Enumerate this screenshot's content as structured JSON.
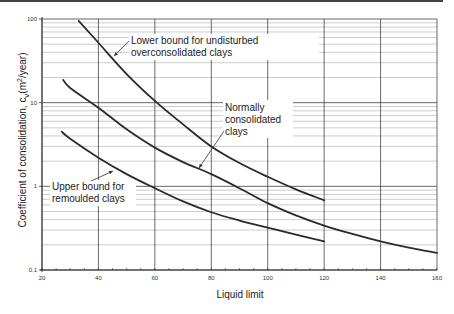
{
  "chart_data": {
    "type": "line",
    "title": "",
    "xlabel": "Liquid limit",
    "ylabel": "Coefficient of consolidation, c",
    "ylabel_subscript": "v",
    "ylabel_units": "(m²/year)",
    "xlim": [
      20,
      160
    ],
    "ylim": [
      0.1,
      100
    ],
    "yscale": "log",
    "grid": true,
    "x_ticks": [
      20,
      40,
      60,
      80,
      100,
      120,
      140,
      160
    ],
    "y_ticks": [
      0.1,
      1,
      10,
      100
    ],
    "y_tick_labels": [
      "0.1",
      "1",
      "10",
      "100"
    ],
    "series": [
      {
        "name": "Lower bound for undisturbed overconsolidated clays",
        "x": [
          33,
          40,
          50,
          60,
          70,
          80,
          90,
          100,
          110,
          120
        ],
        "y": [
          95,
          52,
          22,
          10.5,
          5.5,
          3.0,
          1.9,
          1.3,
          0.92,
          0.68
        ]
      },
      {
        "name": "Normally consolidated clays",
        "x": [
          27.5,
          30,
          40,
          50,
          60,
          70,
          80,
          90,
          100,
          110,
          120,
          130,
          140,
          150,
          160
        ],
        "y": [
          18.7,
          15,
          8.7,
          4.8,
          2.9,
          1.95,
          1.4,
          0.95,
          0.63,
          0.45,
          0.34,
          0.27,
          0.22,
          0.185,
          0.16
        ]
      },
      {
        "name": "Upper bound for remoulded clays",
        "x": [
          27,
          30,
          40,
          50,
          60,
          70,
          80,
          90,
          100,
          110,
          120
        ],
        "y": [
          4.5,
          3.7,
          2.2,
          1.4,
          0.95,
          0.66,
          0.49,
          0.39,
          0.32,
          0.265,
          0.22
        ]
      }
    ],
    "annotations": [
      {
        "lines": [
          "Lower bound for undisturbed",
          "overconsolidated clays"
        ],
        "series": 0
      },
      {
        "lines": [
          "Normally",
          "consolidated",
          "clays"
        ],
        "series": 1
      },
      {
        "lines": [
          "Upper bound for",
          "remoulded clays"
        ],
        "series": 2
      }
    ]
  }
}
